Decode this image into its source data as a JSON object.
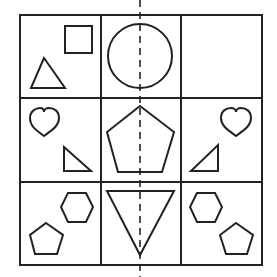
{
  "puzzle": {
    "description": "3x3 grid of shapes with a vertical dashed symmetry line",
    "grid": {
      "rows": 3,
      "cols": 3
    },
    "stroke_color": "#222222",
    "background": "#ffffff",
    "cells": [
      {
        "row": 0,
        "col": 0,
        "shapes": [
          "square",
          "triangle"
        ]
      },
      {
        "row": 0,
        "col": 1,
        "shapes": [
          "circle"
        ]
      },
      {
        "row": 0,
        "col": 2,
        "shapes": []
      },
      {
        "row": 1,
        "col": 0,
        "shapes": [
          "heart",
          "right-triangle"
        ]
      },
      {
        "row": 1,
        "col": 1,
        "shapes": [
          "pentagon"
        ]
      },
      {
        "row": 1,
        "col": 2,
        "shapes": [
          "heart",
          "right-triangle"
        ]
      },
      {
        "row": 2,
        "col": 0,
        "shapes": [
          "hexagon",
          "pentagon"
        ]
      },
      {
        "row": 2,
        "col": 1,
        "shapes": [
          "inverted-triangle"
        ]
      },
      {
        "row": 2,
        "col": 2,
        "shapes": [
          "hexagon",
          "pentagon"
        ]
      }
    ],
    "symmetry_line": "vertical-dashed"
  }
}
